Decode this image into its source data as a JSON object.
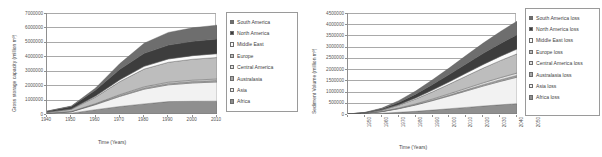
{
  "figure": {
    "panels": [
      {
        "id": "gross-storage-capacity",
        "chart_data": {
          "type": "area",
          "stacked": true,
          "title": "",
          "xlabel": "Time (Years)",
          "ylabel": "Gross storage capacity (million m³)",
          "xlim": [
            1940,
            2010
          ],
          "ylim": [
            0,
            7000000
          ],
          "xticks": [
            "1940",
            "1950",
            "1960",
            "1970",
            "1980",
            "1990",
            "2000",
            "2010"
          ],
          "yticks": [
            "0",
            "1000000",
            "2000000",
            "3000000",
            "4000000",
            "5000000",
            "6000000",
            "7000000"
          ],
          "grid": true,
          "legend_position": "right",
          "x": [
            1940,
            1950,
            1960,
            1970,
            1980,
            1990,
            2000,
            2010
          ],
          "series": [
            {
              "name": "Africa",
              "color": "#8f8f8f",
              "values": [
                20000,
                60000,
                300000,
                520000,
                700000,
                860000,
                880000,
                890000
              ]
            },
            {
              "name": "Asia",
              "color": "#f2f2f2",
              "values": [
                30000,
                90000,
                350000,
                700000,
                1020000,
                1160000,
                1270000,
                1330000
              ]
            },
            {
              "name": "Australasia",
              "color": "#a8a8a8",
              "values": [
                5000,
                15000,
                40000,
                70000,
                90000,
                100000,
                105000,
                110000
              ]
            },
            {
              "name": "Central America",
              "color": "#e2e2e2",
              "values": [
                5000,
                12000,
                30000,
                55000,
                75000,
                85000,
                90000,
                95000
              ]
            },
            {
              "name": "Europe",
              "color": "#bdbdbd",
              "values": [
                60000,
                150000,
                450000,
                900000,
                1230000,
                1380000,
                1450000,
                1490000
              ]
            },
            {
              "name": "Middle East",
              "color": "#fbfbfb",
              "values": [
                10000,
                25000,
                70000,
                130000,
                190000,
                230000,
                250000,
                265000
              ]
            },
            {
              "name": "North America",
              "color": "#3d3d3d",
              "values": [
                60000,
                170000,
                420000,
                720000,
                900000,
                960000,
                990000,
                1010000
              ]
            },
            {
              "name": "South America",
              "color": "#6e6e6e",
              "values": [
                10000,
                30000,
                140000,
                400000,
                700000,
                880000,
                940000,
                965000
              ]
            }
          ],
          "legend": [
            "South America",
            "North America",
            "Middle East",
            "Europe",
            "Central America",
            "Australasia",
            "Asia",
            "Africa"
          ]
        }
      },
      {
        "id": "sediment-volume-loss",
        "chart_data": {
          "type": "area",
          "stacked": true,
          "title": "",
          "xlabel": "Time (Years)",
          "ylabel": "Sediment Volume (million m³)",
          "xlim": [
            1950,
            2050
          ],
          "ylim": [
            0,
            4500000
          ],
          "xticks": [
            "1950",
            "1960",
            "1970",
            "1980",
            "1990",
            "2000",
            "2010",
            "2020",
            "2030",
            "2040",
            "2050"
          ],
          "yticks": [
            "0",
            "500000",
            "1000000",
            "1500000",
            "2000000",
            "2500000",
            "3000000",
            "3500000",
            "4000000",
            "4500000"
          ],
          "grid": true,
          "legend_position": "right",
          "x": [
            1950,
            1960,
            1970,
            1980,
            1990,
            2000,
            2010,
            2020,
            2030,
            2040,
            2050
          ],
          "series": [
            {
              "name": "Africa loss",
              "color": "#8f8f8f",
              "values": [
                0,
                10000,
                35000,
                75000,
                120000,
                175000,
                235000,
                295000,
                355000,
                410000,
                460000
              ]
            },
            {
              "name": "Asia loss",
              "color": "#f2f2f2",
              "values": [
                0,
                20000,
                70000,
                160000,
                280000,
                420000,
                570000,
                730000,
                890000,
                1040000,
                1180000
              ]
            },
            {
              "name": "Australasia loss",
              "color": "#a8a8a8",
              "values": [
                0,
                2000,
                6000,
                13000,
                22000,
                32000,
                42000,
                52000,
                62000,
                70000,
                78000
              ]
            },
            {
              "name": "Central America loss",
              "color": "#e2e2e2",
              "values": [
                0,
                2000,
                7000,
                16000,
                28000,
                42000,
                56000,
                70000,
                84000,
                96000,
                107000
              ]
            },
            {
              "name": "Europe loss",
              "color": "#bdbdbd",
              "values": [
                0,
                15000,
                55000,
                125000,
                215000,
                320000,
                430000,
                545000,
                655000,
                760000,
                855000
              ]
            },
            {
              "name": "Middle East loss",
              "color": "#fbfbfb",
              "values": [
                0,
                3000,
                12000,
                28000,
                50000,
                76000,
                104000,
                133000,
                162000,
                189000,
                214000
              ]
            },
            {
              "name": "North America loss",
              "color": "#3d3d3d",
              "values": [
                0,
                12000,
                45000,
                100000,
                170000,
                250000,
                330000,
                415000,
                495000,
                570000,
                640000
              ]
            },
            {
              "name": "South America loss",
              "color": "#6e6e6e",
              "values": [
                0,
                8000,
                32000,
                75000,
                135000,
                210000,
                290000,
                375000,
                455000,
                530000,
                600000
              ]
            }
          ],
          "legend": [
            "South America loss",
            "North America loss",
            "Middle East loss",
            "Europe loss",
            "Central America loss",
            "Australasia loss",
            "Asia loss",
            "Africa loss"
          ]
        }
      }
    ]
  }
}
